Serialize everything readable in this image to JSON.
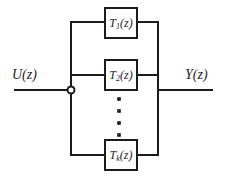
{
  "diagram": {
    "background_color": "#ffffff",
    "line_color": "#1c1c1c",
    "input": {
      "label": "U(z)",
      "label_x": 12,
      "label_y": 68,
      "line_y": 90,
      "line_x_start": 15,
      "line_x_end": 71
    },
    "output": {
      "label": "Y(z)",
      "label_x": 185,
      "label_y": 68,
      "line_y": 90,
      "line_x_start": 158,
      "line_x_end": 212
    },
    "node": {
      "name": "junction-node",
      "x": 71,
      "y": 90,
      "radius": 3.5
    },
    "bus": {
      "left_x": 71,
      "right_x": 158,
      "top_y": 22,
      "bottom_y": 155
    },
    "blocks": [
      {
        "id": "block-t1",
        "base": "T",
        "sub": "1",
        "arg": "(z)",
        "label": "T1(z)",
        "x": 105,
        "y": 8,
        "width": 32,
        "height": 30,
        "row_y": 22
      },
      {
        "id": "block-t2",
        "base": "T",
        "sub": "2",
        "arg": "(z)",
        "label": "T2(z)",
        "x": 105,
        "y": 60,
        "width": 32,
        "height": 30,
        "row_y": 75
      },
      {
        "id": "block-tk",
        "base": "T",
        "sub": "k",
        "arg": "(z)",
        "label": "Tk(z)",
        "x": 105,
        "y": 140,
        "width": 32,
        "height": 30,
        "row_y": 155
      }
    ],
    "ellipsis": {
      "name": "vertical-ellipsis",
      "x": 119,
      "dot_radius": 1.8,
      "dots_y": [
        99,
        111,
        123,
        135
      ]
    }
  }
}
